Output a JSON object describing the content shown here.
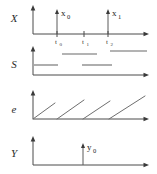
{
  "figure": {
    "width": 157,
    "height": 174,
    "background": "#ffffff",
    "line_color": "#4a4a4a",
    "segment_color": "#9a9a9a",
    "ramp_color": "#6e6e6e",
    "text_color": "#1a1a1a"
  },
  "panels": [
    {
      "id": "X",
      "row_label": "X",
      "type": "impulse-train",
      "axis": {
        "origin_x": 33,
        "baseline_y": 34,
        "x_end": 148,
        "y_top": 6
      },
      "impulses": [
        {
          "name": "x0",
          "label": "x",
          "subscript": "0",
          "x": 57,
          "top_y": 10
        },
        {
          "name": "x1",
          "label": "x",
          "subscript": "1",
          "x": 108,
          "top_y": 10
        }
      ],
      "ticks": [
        {
          "name": "t0",
          "label": "t",
          "subscript": "0",
          "x": 57
        },
        {
          "name": "t1",
          "label": "t",
          "subscript": "1",
          "x": 84
        },
        {
          "name": "t2",
          "label": "t",
          "subscript": "2",
          "x": 108
        }
      ]
    },
    {
      "id": "S",
      "row_label": "S",
      "type": "two-level-segments",
      "axis": {
        "origin_x": 33,
        "baseline_y": 75,
        "x_end": 148,
        "y_top": 47
      },
      "levels": {
        "low_y": 65,
        "high_y": 54
      },
      "segments": [
        {
          "name": "s-low-1",
          "level": "low",
          "x_start": 34,
          "x_end": 58
        },
        {
          "name": "s-high-1",
          "level": "high",
          "x_start": 62,
          "x_end": 97
        },
        {
          "name": "s-low-2",
          "level": "low",
          "x_start": 82,
          "x_end": 112
        },
        {
          "name": "s-high-2",
          "level": "high",
          "x_start": 110,
          "x_end": 147
        }
      ]
    },
    {
      "id": "e",
      "row_label": "e",
      "type": "sawtooth",
      "axis": {
        "origin_x": 33,
        "baseline_y": 119,
        "x_end": 148,
        "y_top": 91
      },
      "ramps": [
        {
          "name": "ramp-1",
          "x_start": 33,
          "x_end": 55,
          "y_peak": 103
        },
        {
          "name": "ramp-2",
          "x_start": 57,
          "x_end": 84,
          "y_peak": 100
        },
        {
          "name": "ramp-3",
          "x_start": 83,
          "x_end": 110,
          "y_peak": 101
        },
        {
          "name": "ramp-4",
          "x_start": 109,
          "x_end": 145,
          "y_peak": 96
        }
      ]
    },
    {
      "id": "Y",
      "row_label": "Y",
      "type": "impulse-train",
      "axis": {
        "origin_x": 33,
        "baseline_y": 165,
        "x_end": 148,
        "y_top": 137
      },
      "impulses": [
        {
          "name": "y0",
          "label": "y",
          "subscript": "0",
          "x": 83,
          "top_y": 145
        }
      ],
      "ticks": []
    }
  ],
  "labels": {
    "row_X": "X",
    "row_S": "S",
    "row_e": "e",
    "row_Y": "Y",
    "x0_base": "x",
    "x0_sub": "0",
    "x1_base": "x",
    "x1_sub": "1",
    "y0_base": "y",
    "y0_sub": "0",
    "t0_base": "t",
    "t0_sub": "0",
    "t1_base": "t",
    "t1_sub": "1",
    "t2_base": "t",
    "t2_sub": "2"
  }
}
